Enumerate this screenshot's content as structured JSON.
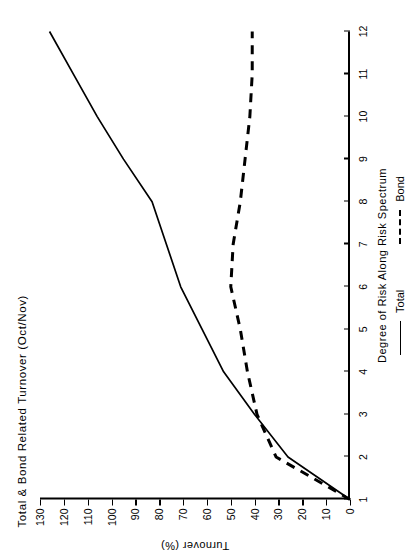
{
  "chart_data": {
    "type": "line",
    "title": "Total & Bond Related Turnover (Oct/Nov)",
    "xlabel": "Degree of Risk Along Risk Spectrum",
    "ylabel": "Turnover (%)",
    "xlim": [
      1,
      12
    ],
    "ylim": [
      0,
      130
    ],
    "xticks": [
      1,
      2,
      3,
      4,
      5,
      6,
      7,
      8,
      9,
      10,
      11,
      12
    ],
    "yticks": [
      0,
      10,
      20,
      30,
      40,
      50,
      60,
      70,
      80,
      90,
      100,
      110,
      120,
      130
    ],
    "grid": false,
    "legend_position": "below-axis",
    "orientation": "rotated-90-ccw",
    "x": [
      1,
      2,
      3,
      4,
      5,
      6,
      7,
      8,
      9,
      10,
      11,
      12
    ],
    "series": [
      {
        "name": "Total",
        "style": "solid",
        "color": "#000000",
        "values": [
          0,
          26,
          40,
          53,
          62,
          71,
          77,
          83,
          95,
          106,
          116,
          126
        ]
      },
      {
        "name": "Bond",
        "style": "dashed",
        "color": "#000000",
        "values": [
          0,
          31,
          39,
          43,
          46,
          50,
          49,
          46,
          44,
          42,
          41,
          41
        ]
      }
    ]
  },
  "legend": {
    "items": [
      {
        "label": "Total",
        "style": "solid"
      },
      {
        "label": "Bond",
        "style": "dashed"
      }
    ]
  }
}
